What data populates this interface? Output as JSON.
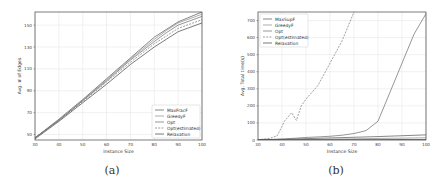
{
  "chart_data": [
    {
      "id": "a",
      "type": "line",
      "caption": "(a)",
      "title": "",
      "xlabel": "Instance Size",
      "ylabel": "Avg. # of Edges",
      "xlim": [
        30,
        100
      ],
      "ylim": [
        45,
        162
      ],
      "xticks": [
        30,
        40,
        50,
        60,
        70,
        80,
        90,
        100
      ],
      "yticks": [
        50,
        70,
        90,
        110,
        130,
        150
      ],
      "grid": true,
      "legend_position": "lower right",
      "x": [
        30,
        40,
        50,
        60,
        70,
        80,
        85,
        90,
        100
      ],
      "series": [
        {
          "name": "MaxFracF",
          "style": "solid",
          "values": [
            47,
            64,
            82,
            101,
            120,
            139,
            146,
            153,
            162
          ]
        },
        {
          "name": "GreedyF",
          "style": "solid",
          "values": [
            47,
            63,
            81,
            100,
            119,
            137,
            145,
            152,
            160
          ]
        },
        {
          "name": "Opt",
          "style": "solid",
          "values": [
            47,
            63,
            81,
            99,
            118,
            135,
            143,
            150,
            158
          ]
        },
        {
          "name": "Opt(estimated)",
          "style": "dashed",
          "values": [
            47,
            63,
            80,
            98,
            116,
            133,
            140,
            147,
            155
          ]
        },
        {
          "name": "Relaxation",
          "style": "solid",
          "values": [
            46,
            62,
            79,
            96,
            114,
            130,
            137,
            144,
            152
          ]
        }
      ]
    },
    {
      "id": "b",
      "type": "line",
      "caption": "(b)",
      "title": "",
      "xlabel": "Instance Size",
      "ylabel": "Avg. Total time(s)",
      "xlim": [
        30,
        100
      ],
      "ylim": [
        0,
        750
      ],
      "xticks": [
        30,
        40,
        50,
        60,
        70,
        80,
        90,
        100
      ],
      "yticks": [
        0,
        100,
        200,
        300,
        400,
        500,
        600,
        700
      ],
      "grid": true,
      "legend_position": "upper left",
      "series": [
        {
          "name": "MaxSupF",
          "style": "solid",
          "x": [
            30,
            40,
            50,
            60,
            70,
            80,
            90,
            100
          ],
          "values": [
            1,
            4,
            8,
            12,
            16,
            20,
            25,
            30
          ]
        },
        {
          "name": "GreedyF",
          "style": "solid",
          "x": [
            30,
            40,
            50,
            60,
            70,
            80,
            90,
            100
          ],
          "values": [
            0,
            1,
            3,
            5,
            7,
            9,
            11,
            13
          ]
        },
        {
          "name": "Opt",
          "style": "solid",
          "x": [
            30,
            35,
            40,
            45,
            50,
            55,
            60,
            65,
            70,
            75,
            80,
            85,
            90,
            95,
            100
          ],
          "values": [
            1,
            3,
            6,
            10,
            15,
            18,
            22,
            28,
            38,
            55,
            110,
            280,
            450,
            620,
            740
          ]
        },
        {
          "name": "Opt(estimated)",
          "style": "dashed",
          "x": [
            30,
            35,
            38,
            40,
            41,
            44,
            46,
            48,
            50,
            55,
            60,
            65,
            70
          ],
          "values": [
            2,
            10,
            25,
            80,
            110,
            160,
            115,
            200,
            240,
            320,
            450,
            580,
            750
          ]
        },
        {
          "name": "Relaxation",
          "style": "solid",
          "x": [
            30,
            40,
            50,
            60,
            70,
            80,
            90,
            100
          ],
          "values": [
            0,
            0,
            1,
            1,
            2,
            2,
            3,
            3
          ]
        }
      ]
    }
  ]
}
